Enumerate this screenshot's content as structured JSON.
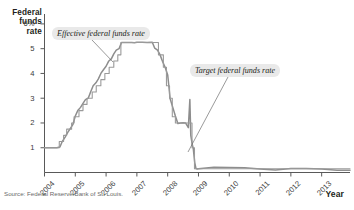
{
  "axes": {
    "y_title": "Federal funds rate",
    "x_title": "Year",
    "y_ticks": [
      "6%",
      "5",
      "4",
      "3",
      "2",
      "1"
    ],
    "x_ticks": [
      "2004",
      "2005",
      "2006",
      "2007",
      "2008",
      "2009",
      "2010",
      "2011",
      "2012",
      "2013"
    ]
  },
  "annotations": {
    "effective": "Effective federal funds rate",
    "target": "Target federal funds rate"
  },
  "source": "Source: Federal Reserve Bank of St. Louis.",
  "colors": {
    "effective_line": "#8d8d8d",
    "target_line": "#9a9a9a",
    "axis": "#595959",
    "callout_bg": "#e9e9e9",
    "text": "#231f20"
  },
  "chart_data": {
    "type": "line",
    "title": "",
    "xlabel": "Year",
    "ylabel": "Federal funds rate",
    "xlim": [
      2004.0,
      2013.92
    ],
    "ylim": [
      0,
      6.4
    ],
    "grid": false,
    "legend": "annotations-inline",
    "x_tick_values": [
      2004,
      2005,
      2006,
      2007,
      2008,
      2009,
      2010,
      2011,
      2012,
      2013
    ],
    "y_tick_values": [
      1,
      2,
      3,
      4,
      5,
      6
    ],
    "series": [
      {
        "name": "Effective federal funds rate",
        "color": "#8d8d8d",
        "x": [
          2004.0,
          2004.2,
          2004.4,
          2004.5,
          2004.58,
          2004.67,
          2004.75,
          2004.83,
          2004.92,
          2005.0,
          2005.08,
          2005.17,
          2005.25,
          2005.33,
          2005.42,
          2005.5,
          2005.58,
          2005.67,
          2005.75,
          2005.83,
          2005.92,
          2006.0,
          2006.08,
          2006.17,
          2006.25,
          2006.33,
          2006.42,
          2006.5,
          2006.58,
          2006.67,
          2006.75,
          2006.83,
          2006.92,
          2007.0,
          2007.17,
          2007.33,
          2007.5,
          2007.58,
          2007.67,
          2007.75,
          2007.83,
          2007.92,
          2008.0,
          2008.08,
          2008.17,
          2008.25,
          2008.33,
          2008.42,
          2008.5,
          2008.58,
          2008.67,
          2008.72,
          2008.75,
          2008.8,
          2008.83,
          2008.88,
          2008.92,
          2008.96,
          2009.0,
          2009.25,
          2009.5,
          2010.0,
          2010.5,
          2011.0,
          2011.5,
          2012.0,
          2012.5,
          2013.0,
          2013.5,
          2013.92
        ],
        "y": [
          1.0,
          1.0,
          1.0,
          1.03,
          1.26,
          1.43,
          1.61,
          1.76,
          1.93,
          2.28,
          2.5,
          2.63,
          2.79,
          2.94,
          3.0,
          3.26,
          3.5,
          3.62,
          3.78,
          4.0,
          4.16,
          4.29,
          4.49,
          4.59,
          4.79,
          4.94,
          5.0,
          5.25,
          5.25,
          5.25,
          5.25,
          5.25,
          5.24,
          5.26,
          5.26,
          5.25,
          5.26,
          5.02,
          4.94,
          4.76,
          4.49,
          4.24,
          3.94,
          2.98,
          2.61,
          2.28,
          1.98,
          2.0,
          2.01,
          2.0,
          1.81,
          2.95,
          1.5,
          1.12,
          0.97,
          0.39,
          0.16,
          0.14,
          0.15,
          0.18,
          0.21,
          0.2,
          0.19,
          0.14,
          0.1,
          0.16,
          0.16,
          0.14,
          0.09,
          0.09
        ]
      },
      {
        "name": "Target federal funds rate",
        "color": "#9a9a9a",
        "x": [
          2004.0,
          2004.48,
          2004.48,
          2004.62,
          2004.62,
          2004.72,
          2004.72,
          2004.88,
          2004.88,
          2004.96,
          2004.96,
          2005.12,
          2005.12,
          2005.25,
          2005.25,
          2005.38,
          2005.38,
          2005.55,
          2005.55,
          2005.68,
          2005.68,
          2005.83,
          2005.83,
          2005.96,
          2005.96,
          2006.1,
          2006.1,
          2006.25,
          2006.25,
          2006.38,
          2006.38,
          2006.48,
          2006.48,
          2007.7,
          2007.7,
          2007.86,
          2007.86,
          2007.96,
          2007.96,
          2008.06,
          2008.06,
          2008.15,
          2008.15,
          2008.25,
          2008.25,
          2008.34,
          2008.34,
          2008.79,
          2008.79,
          2008.87,
          2008.87,
          2013.92
        ],
        "y": [
          1.0,
          1.0,
          1.25,
          1.25,
          1.5,
          1.5,
          1.75,
          1.75,
          2.0,
          2.0,
          2.25,
          2.25,
          2.5,
          2.5,
          2.75,
          2.75,
          3.0,
          3.0,
          3.25,
          3.25,
          3.5,
          3.5,
          3.75,
          3.75,
          4.0,
          4.0,
          4.25,
          4.25,
          4.5,
          4.5,
          4.75,
          4.75,
          5.25,
          5.25,
          4.75,
          4.75,
          4.25,
          4.25,
          3.5,
          3.5,
          3.0,
          3.0,
          2.25,
          2.25,
          2.0,
          2.0,
          2.0,
          2.0,
          1.0,
          1.0,
          0.15,
          0.15
        ]
      }
    ],
    "notes": [
      "Effective rate held near 1% through mid-2004, rose in steps to a 5.25% plateau from mid-2006 to late 2007, fell sharply through 2008 to near zero, and stayed near zero through 2013.",
      "Target rate is a step function mirroring FOMC decisions, floored at 0-0.25% from December 2008."
    ]
  }
}
